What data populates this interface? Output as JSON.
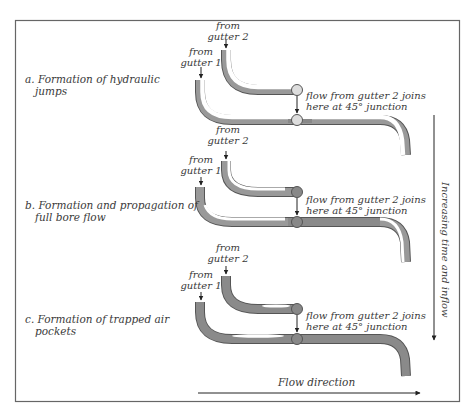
{
  "figure": {
    "panels": [
      {
        "id": "a",
        "label_line1": "a. Formation of hydraulic",
        "label_line2": "jumps",
        "gutter1_label_line1": "from",
        "gutter1_label_line2": "gutter 1",
        "gutter2_label_line1": "from",
        "gutter2_label_line2": "gutter 2",
        "junction_note_line1": "flow from gutter 2 joins",
        "junction_note_line2": "here at 45° junction"
      },
      {
        "id": "b",
        "label_line1": "b. Formation and propagation of",
        "label_line2": "full bore flow",
        "gutter1_label_line1": "from",
        "gutter1_label_line2": "gutter 1",
        "gutter2_label_line1": "from",
        "gutter2_label_line2": "gutter 2",
        "junction_note_line1": "flow from gutter 2 joins",
        "junction_note_line2": "here at 45° junction"
      },
      {
        "id": "c",
        "label_line1": "c. Formation of trapped air",
        "label_line2": "pockets",
        "gutter1_label_line1": "from",
        "gutter1_label_line2": "gutter 1",
        "gutter2_label_line1": "from",
        "gutter2_label_line2": "gutter 2",
        "junction_note_line1": "flow from gutter 2 joins",
        "junction_note_line2": "here at 45° junction"
      }
    ],
    "time_axis_label": "Increasing time and inflow",
    "flow_axis_label": "Flow direction",
    "colors": {
      "pipe_fill": "#8a8a8a",
      "pipe_outline": "#555555",
      "pipe_empty": "#ffffff",
      "frame": "#666666",
      "text": "#3a3a3a"
    }
  }
}
